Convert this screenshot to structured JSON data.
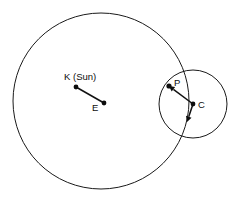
{
  "figure": {
    "background_color": "#ffffff",
    "stroke_color": "#1a1a1a",
    "accent_color": "#0d0d0d",
    "width": 238,
    "height": 204
  },
  "labels": {
    "sun": "K (Sun)",
    "earth": "E",
    "planet": "P",
    "centre": "C"
  },
  "geometry": {
    "deferent": {
      "cx": 101,
      "cy": 101,
      "r": 88
    },
    "epicycle": {
      "cx": 193,
      "cy": 104,
      "r": 34
    },
    "points": {
      "K": {
        "x": 76,
        "y": 87
      },
      "E": {
        "x": 104,
        "y": 103
      },
      "P": {
        "x": 169,
        "y": 86
      },
      "C": {
        "x": 193,
        "y": 104
      }
    },
    "segments": [
      {
        "name": "K-E",
        "from": "K",
        "to": "E"
      },
      {
        "name": "C-P",
        "from": "C",
        "to": "P"
      }
    ],
    "arrows": [
      {
        "name": "arrow-to-planet",
        "x1": 193,
        "y1": 104,
        "x2": 169,
        "y2": 86
      },
      {
        "name": "arrow-downward",
        "x1": 193,
        "y1": 104,
        "x2": 187,
        "y2": 122
      }
    ]
  },
  "label_positions": {
    "sun": {
      "x": 64,
      "y": 80
    },
    "earth": {
      "x": 92,
      "y": 111
    },
    "planet": {
      "x": 174,
      "y": 86
    },
    "centre": {
      "x": 198,
      "y": 108
    }
  }
}
